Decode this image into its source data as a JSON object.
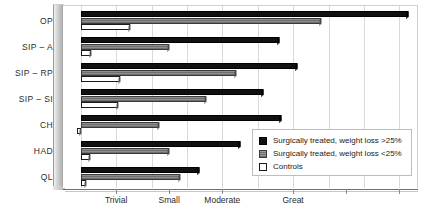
{
  "chart_data": {
    "type": "bar",
    "orientation": "horizontal",
    "title": "",
    "xlabel": "",
    "ylabel": "",
    "categories": [
      "OP",
      "SIP – A",
      "SIP – RP",
      "SIP – SI",
      "CH",
      "HAD",
      "QL"
    ],
    "xtick_labels": [
      "Trivial",
      "Small",
      "Moderate",
      "Great"
    ],
    "xtick_values": [
      0.2,
      0.5,
      0.8,
      1.2
    ],
    "xlim": [
      -0.1,
      1.9
    ],
    "grid": "vertical",
    "legend_position": "lower-right",
    "series": [
      {
        "name": "Surgically treated, weight loss >25%",
        "color": "#111111",
        "values": [
          1.85,
          1.12,
          1.22,
          1.03,
          1.13,
          0.9,
          0.67
        ]
      },
      {
        "name": "Surgically treated, weight loss <25%",
        "color": "#7d7d7d",
        "values": [
          1.36,
          0.5,
          0.88,
          0.71,
          0.44,
          0.5,
          0.56
        ]
      },
      {
        "name": "Controls",
        "color": "#ffffff",
        "values": [
          0.28,
          0.06,
          0.22,
          0.21,
          -0.02,
          0.05,
          0.03
        ]
      }
    ]
  },
  "legend": {
    "entries": [
      {
        "label": "Surgically treated, weight loss >25%",
        "swatch": "solid-black-swatch"
      },
      {
        "label": "Surgically treated, weight loss <25%",
        "swatch": "hatched-gray-swatch"
      },
      {
        "label": "Controls",
        "swatch": "outlined-white-swatch"
      }
    ]
  }
}
